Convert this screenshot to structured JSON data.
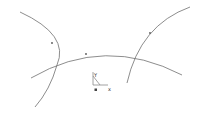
{
  "canvas": {
    "width": 201,
    "height": 113,
    "background": "#ffffff"
  },
  "colors": {
    "stroke": "#707070",
    "node": "#555555",
    "ucs": "#8a8a8a"
  },
  "arcs": [
    {
      "name": "left-arc",
      "d": "M20,12 Q70,35 57,65 Q50,90 35,107",
      "nodes": [
        [
          52,
          43
        ]
      ]
    },
    {
      "name": "middle-arc",
      "d": "M31,78 Q105,35 182,75",
      "nodes": [
        [
          86,
          54
        ]
      ]
    },
    {
      "name": "right-arc",
      "d": "M190,7 Q140,25 127,83",
      "nodes": [
        [
          150,
          33
        ]
      ]
    }
  ],
  "ucs_icon": {
    "y_label": "Y",
    "x_label": "x",
    "origin": [
      96,
      88
    ]
  }
}
